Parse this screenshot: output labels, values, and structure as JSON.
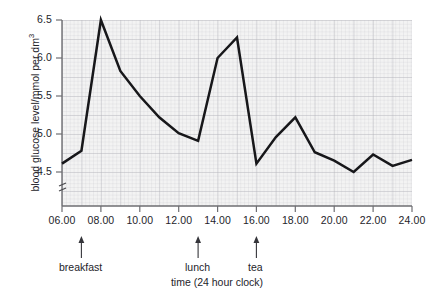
{
  "chart_data": {
    "type": "line",
    "title": "",
    "xlabel": "time (24 hour clock)",
    "ylabel": "blood glucose level/mmol per dm",
    "ylabel_exponent": "3",
    "xlim": [
      6,
      24
    ],
    "ylim": [
      4.25,
      6.5
    ],
    "ytick_labels": [
      "6.5",
      "6.0",
      "5.5",
      "5.0",
      "4.5"
    ],
    "ytick_values": [
      6.5,
      6.0,
      5.5,
      5.0,
      4.5
    ],
    "xtick_labels": [
      "06.00",
      "08.00",
      "10.00",
      "12.00",
      "14.00",
      "16.00",
      "18.00",
      "20.00",
      "22.00",
      "24.00"
    ],
    "xtick_values": [
      6,
      8,
      10,
      12,
      14,
      16,
      18,
      20,
      22,
      24
    ],
    "grid": true,
    "legend": "none",
    "y_axis_break": true,
    "x": [
      6,
      7,
      8,
      9,
      10,
      11,
      12,
      13,
      14,
      15,
      16,
      17,
      18,
      19,
      20,
      21,
      22,
      23,
      24
    ],
    "values": [
      4.61,
      4.78,
      6.5,
      5.83,
      5.5,
      5.22,
      5.01,
      4.91,
      6.0,
      6.27,
      4.61,
      4.96,
      5.22,
      4.76,
      4.65,
      4.5,
      4.73,
      4.58,
      4.66
    ],
    "annotations": [
      {
        "label": "breakfast",
        "x": 7
      },
      {
        "label": "lunch",
        "x": 13
      },
      {
        "label": "tea",
        "x": 16
      }
    ]
  }
}
